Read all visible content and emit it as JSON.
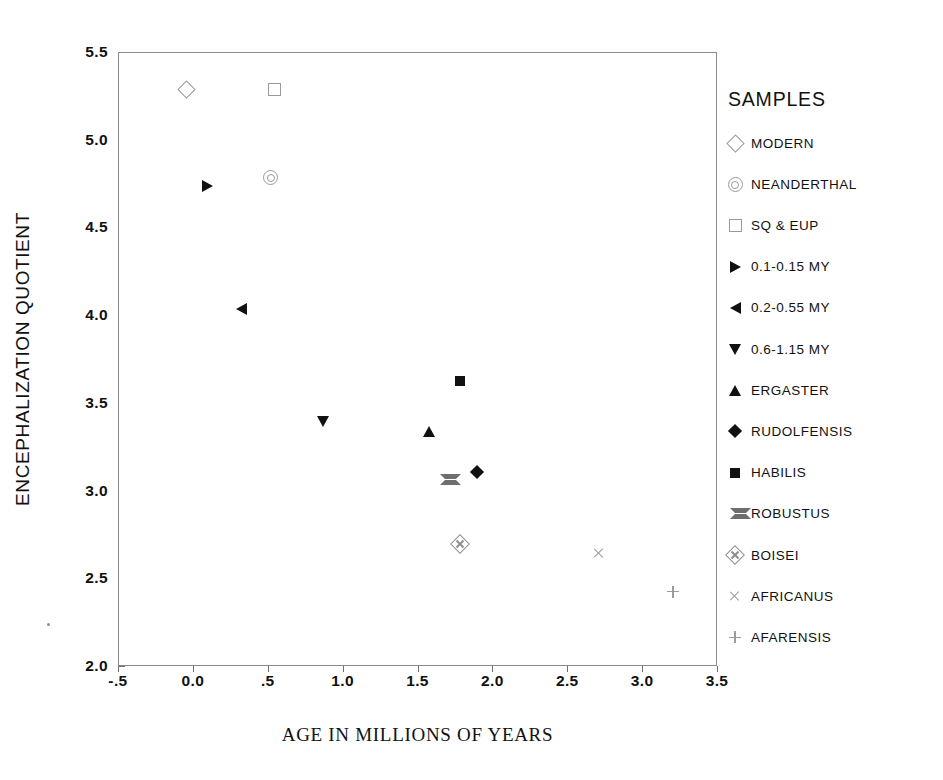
{
  "chart_data": {
    "type": "scatter",
    "title": "",
    "xlabel": "AGE IN MILLIONS OF YEARS",
    "ylabel": "ENCEPHALIZATION QUOTIENT",
    "xlim": [
      -0.5,
      3.5
    ],
    "ylim": [
      2.0,
      5.5
    ],
    "xticks": [
      "-.5",
      "0.0",
      ".5",
      "1.0",
      "1.5",
      "2.0",
      "2.5",
      "3.0",
      "3.5"
    ],
    "xtick_values": [
      -0.5,
      0.0,
      0.5,
      1.0,
      1.5,
      2.0,
      2.5,
      3.0,
      3.5
    ],
    "yticks": [
      "2.0",
      "2.5",
      "3.0",
      "3.5",
      "4.0",
      "4.5",
      "5.0",
      "5.5"
    ],
    "ytick_values": [
      2.0,
      2.5,
      3.0,
      3.5,
      4.0,
      4.5,
      5.0,
      5.5
    ],
    "grid": false,
    "legend_position": "right",
    "legend_title": "SAMPLES",
    "series": [
      {
        "name": "MODERN",
        "marker": "diamond-open",
        "x": [
          -0.05
        ],
        "y": [
          5.29
        ]
      },
      {
        "name": "NEANDERTHAL",
        "marker": "circle-target",
        "x": [
          0.51
        ],
        "y": [
          4.79
        ]
      },
      {
        "name": "SQ & EUP",
        "marker": "square-open",
        "x": [
          0.54
        ],
        "y": [
          5.29
        ]
      },
      {
        "name": "0.1-0.15 MY",
        "marker": "triangle-right",
        "x": [
          0.09
        ],
        "y": [
          4.74
        ]
      },
      {
        "name": "0.2-0.55 MY",
        "marker": "triangle-left",
        "x": [
          0.32
        ],
        "y": [
          4.04
        ]
      },
      {
        "name": "0.6-1.15 MY",
        "marker": "triangle-down",
        "x": [
          0.86
        ],
        "y": [
          3.4
        ]
      },
      {
        "name": "ERGASTER",
        "marker": "triangle-up",
        "x": [
          1.57
        ],
        "y": [
          3.34
        ]
      },
      {
        "name": "RUDOLFENSIS",
        "marker": "diamond-filled",
        "x": [
          1.89
        ],
        "y": [
          3.11
        ]
      },
      {
        "name": "HABILIS",
        "marker": "square-filled",
        "x": [
          1.78
        ],
        "y": [
          3.63
        ]
      },
      {
        "name": "ROBUSTUS",
        "marker": "bowtie",
        "x": [
          1.68
        ],
        "y": [
          3.07
        ]
      },
      {
        "name": "BOISEI",
        "marker": "diamond-plus",
        "x": [
          1.78
        ],
        "y": [
          2.7
        ]
      },
      {
        "name": "AFRICANUS",
        "marker": "x-cross",
        "x": [
          2.7
        ],
        "y": [
          2.65
        ]
      },
      {
        "name": "AFARENSIS",
        "marker": "plus",
        "x": [
          3.2
        ],
        "y": [
          2.43
        ]
      }
    ]
  },
  "legend": {
    "title": "SAMPLES",
    "items": [
      {
        "label": "MODERN",
        "marker": "diamond-open"
      },
      {
        "label": "NEANDERTHAL",
        "marker": "circle-target"
      },
      {
        "label": "SQ & EUP",
        "marker": "square-open"
      },
      {
        "label": "0.1-0.15 MY",
        "marker": "triangle-right"
      },
      {
        "label": "0.2-0.55 MY",
        "marker": "triangle-left"
      },
      {
        "label": "0.6-1.15 MY",
        "marker": "triangle-down"
      },
      {
        "label": "ERGASTER",
        "marker": "triangle-up"
      },
      {
        "label": "RUDOLFENSIS",
        "marker": "diamond-filled"
      },
      {
        "label": "HABILIS",
        "marker": "square-filled"
      },
      {
        "label": "ROBUSTUS",
        "marker": "bowtie"
      },
      {
        "label": "BOISEI",
        "marker": "diamond-plus"
      },
      {
        "label": "AFRICANUS",
        "marker": "x-cross"
      },
      {
        "label": "AFARENSIS",
        "marker": "plus"
      }
    ]
  },
  "colors": {
    "axis": "#8a8a8a",
    "text": "#111111",
    "marker_filled": "#111111",
    "marker_open": "#9a9a9a",
    "background": "#ffffff"
  }
}
